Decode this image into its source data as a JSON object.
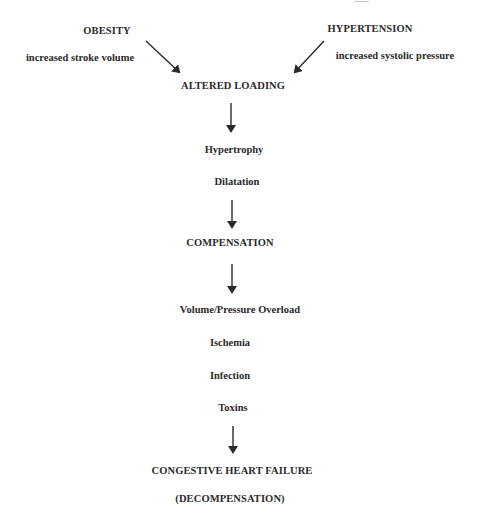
{
  "diagram": {
    "inputs": [
      {
        "title": "OBESITY",
        "subtitle": "increased stroke volume"
      },
      {
        "title": "HYPERTENSION",
        "subtitle": "increased systolic pressure"
      }
    ],
    "nodes": {
      "altered_loading": "ALTERED LOADING",
      "adaptations": [
        "Hypertrophy",
        "Dilatation"
      ],
      "compensation": "COMPENSATION",
      "stressors": [
        "Volume/Pressure Overload",
        "Ischemia",
        "Infection",
        "Toxins"
      ],
      "outcome": "CONGESTIVE HEART FAILURE",
      "outcome_sub": "(DECOMPENSATION)"
    },
    "arrow_color": "#2a2a2a"
  }
}
